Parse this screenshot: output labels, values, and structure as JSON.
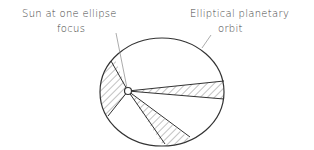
{
  "diagram": {
    "type": "kepler-second-law",
    "labels": {
      "sun_line1": "Sun at one ellipse",
      "sun_line2": "focus",
      "orbit_line1": "Elliptical planetary",
      "orbit_line2": "orbit"
    },
    "colors": {
      "stroke": "#333333",
      "hatch": "#555555",
      "leader": "#777777",
      "text": "#444444"
    },
    "orbit": {
      "cx": 162,
      "cy": 92,
      "rx": 62,
      "ry": 54
    },
    "sun": {
      "x": 128,
      "y": 91,
      "r": 3.5
    },
    "sectors": [
      {
        "name": "left-sector",
        "p1": [
          111,
          61
        ],
        "p2": [
          108,
          116
        ]
      },
      {
        "name": "right-sector",
        "p1": [
          224,
          81
        ],
        "p2": [
          224,
          99
        ]
      },
      {
        "name": "bottom-sector",
        "p1": [
          165,
          144
        ],
        "p2": [
          190,
          137
        ]
      }
    ]
  }
}
